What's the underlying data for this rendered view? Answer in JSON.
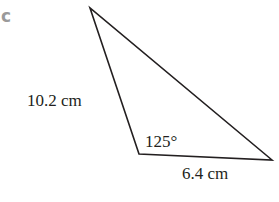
{
  "part_label": "c",
  "triangle": {
    "vertices": {
      "top": [
        90,
        8
      ],
      "bottom_left": [
        139,
        154
      ],
      "right": [
        272,
        160
      ]
    },
    "stroke_color": "#231f20",
    "side_left": "10.2 cm",
    "side_bottom": "6.4 cm",
    "angle": "125°"
  }
}
